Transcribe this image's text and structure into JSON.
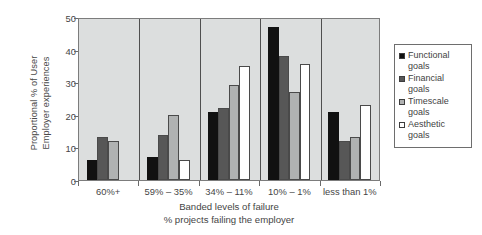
{
  "chart_data": {
    "type": "bar",
    "title": "",
    "categories": [
      "60%+",
      "59% – 35%",
      "34% – 11%",
      "10% – 1%",
      "less than 1%"
    ],
    "series": [
      {
        "name": "Functional goals",
        "color": "#111111",
        "values": [
          6,
          7,
          21,
          47,
          21
        ]
      },
      {
        "name": "Financial goals",
        "color": "#575757",
        "values": [
          13.3,
          13.7,
          22,
          38,
          12
        ]
      },
      {
        "name": "Timescale goals",
        "color": "#b0b2b2",
        "values": [
          12,
          20,
          29,
          27,
          13.3
        ]
      },
      {
        "name": "Aesthetic goals",
        "color": "#ffffff",
        "values": [
          0,
          6,
          35,
          35.7,
          23
        ]
      }
    ],
    "xlabel_line1": "Banded levels of failure",
    "xlabel_line2": "% projects failing the employer",
    "ylabel_line1": "Proportional % of User",
    "ylabel_line2": "Employer experiences",
    "ylim": [
      0,
      50
    ],
    "yticks": [
      0,
      10,
      20,
      30,
      40,
      50
    ],
    "ytick_labels": [
      "0",
      "10",
      "20",
      "30",
      "40",
      "50"
    ],
    "grid": false,
    "legend_position": "right",
    "plot_background": "#dcdede",
    "axis_color": "#7c7c7c"
  }
}
